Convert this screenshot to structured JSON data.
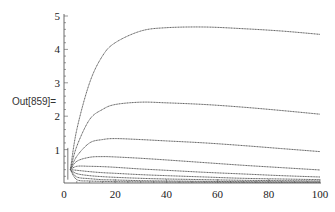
{
  "cell": {
    "output_label": "Out[859]="
  },
  "chart_data": {
    "type": "line",
    "title": "",
    "xlabel": "",
    "ylabel": "",
    "xlim": [
      0,
      100
    ],
    "ylim": [
      0,
      5
    ],
    "x_ticks": [
      0,
      20,
      40,
      60,
      80,
      100
    ],
    "y_ticks": [
      1,
      2,
      3,
      4,
      5
    ],
    "grid": false,
    "legend": null,
    "line_color": "#555555",
    "spike": {
      "x": 1.5,
      "from": 0.1,
      "to": 1.05
    },
    "x": [
      2.5,
      5,
      10,
      15,
      20,
      30,
      40,
      55,
      70,
      85,
      100
    ],
    "series": [
      {
        "name": "curve-1",
        "values": [
          0.4,
          1.6,
          3.0,
          3.8,
          4.2,
          4.55,
          4.65,
          4.67,
          4.62,
          4.55,
          4.45
        ]
      },
      {
        "name": "curve-2",
        "values": [
          0.4,
          1.1,
          1.9,
          2.2,
          2.35,
          2.42,
          2.4,
          2.35,
          2.27,
          2.17,
          2.06
        ]
      },
      {
        "name": "curve-3",
        "values": [
          0.4,
          0.8,
          1.2,
          1.3,
          1.33,
          1.3,
          1.26,
          1.2,
          1.12,
          1.03,
          0.94
        ]
      },
      {
        "name": "curve-4",
        "values": [
          0.4,
          0.65,
          0.77,
          0.79,
          0.78,
          0.74,
          0.69,
          0.61,
          0.53,
          0.46,
          0.39
        ]
      },
      {
        "name": "curve-5",
        "values": [
          0.4,
          0.5,
          0.5,
          0.49,
          0.47,
          0.42,
          0.38,
          0.32,
          0.27,
          0.22,
          0.18
        ]
      },
      {
        "name": "curve-6",
        "values": [
          0.4,
          0.38,
          0.34,
          0.31,
          0.29,
          0.25,
          0.22,
          0.18,
          0.14,
          0.12,
          0.1
        ]
      },
      {
        "name": "curve-7",
        "values": [
          0.4,
          0.28,
          0.22,
          0.19,
          0.17,
          0.14,
          0.12,
          0.1,
          0.08,
          0.07,
          0.06
        ]
      },
      {
        "name": "curve-8",
        "values": [
          0.4,
          0.18,
          0.13,
          0.1,
          0.09,
          0.07,
          0.06,
          0.05,
          0.04,
          0.035,
          0.03
        ]
      },
      {
        "name": "curve-9",
        "values": [
          0.4,
          0.1,
          0.06,
          0.05,
          0.04,
          0.035,
          0.03,
          0.025,
          0.02,
          0.02,
          0.02
        ]
      }
    ]
  }
}
